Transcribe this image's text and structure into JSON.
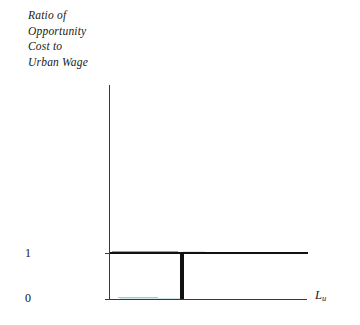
{
  "chart_data": {
    "type": "line",
    "title": "",
    "ylabel": "Ratio of\nOpportunity\nCost to\nUrban Wage",
    "xlabel": "L",
    "xlabel_subscript": "u",
    "ytick_labels": [
      "1",
      "0"
    ],
    "ytick_values": [
      1,
      0
    ],
    "ylim": [
      0,
      1.45
    ],
    "xlim": [
      0,
      1
    ],
    "grid": false,
    "legend": false,
    "series": [
      {
        "name": "Ratio of opportunity cost to urban wage",
        "step": "post",
        "x": [
          0.0,
          0.355,
          0.355,
          0.365,
          0.365,
          1.0
        ],
        "values": [
          1,
          1,
          0,
          0,
          1,
          1
        ],
        "color": "#111111",
        "description": "Step function: equals 1 on first interval, drops to 0 over a narrow gap, then returns to 1 and stays at 1"
      }
    ],
    "annotations": []
  },
  "axes": {
    "y_axis_title_lines": [
      "Ratio of",
      "Opportunity",
      "Cost to",
      "Urban Wage"
    ],
    "x_axis_label": "L",
    "x_axis_label_sub": "u",
    "tick_1": "1",
    "tick_0": "0"
  },
  "colors": {
    "series": "#111111",
    "axis": "#3a3a3a",
    "text": "#111111",
    "background": "#ffffff"
  }
}
